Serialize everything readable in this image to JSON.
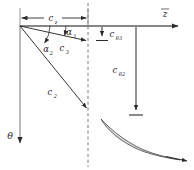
{
  "figure": {
    "type": "engineering-vector-diagram"
  },
  "axes": {
    "horizontal": {
      "name": "z-axis",
      "label": "z",
      "direction": "right",
      "x_start": 20,
      "x_end": 180,
      "y": 26
    },
    "vertical": {
      "name": "theta-axis",
      "label": "θ",
      "direction": "down",
      "x": 20,
      "y_start": 26,
      "y_end": 150
    }
  },
  "station_line": {
    "name": "station-dashed-line",
    "x": 88,
    "y_start": 4,
    "y_end": 166,
    "style": "dashed"
  },
  "dimension": {
    "label": "c",
    "subscript": "z",
    "full": "c_z",
    "y": 18,
    "x_start": 20,
    "x_end": 88
  },
  "vectors": [
    {
      "id": "c3",
      "label": "c",
      "subscript": "3",
      "full": "c_3",
      "x1": 20,
      "y1": 26,
      "x2": 88,
      "y2": 41,
      "label_x": 63,
      "label_y": 51
    },
    {
      "id": "c2",
      "label": "c",
      "subscript": "2",
      "full": "c_2",
      "x1": 20,
      "y1": 26,
      "x2": 88,
      "y2": 110,
      "label_x": 52,
      "label_y": 95
    }
  ],
  "angles": [
    {
      "id": "alpha3",
      "label": "α",
      "subscript": "3",
      "full": "α_3",
      "label_x": 69,
      "label_y": 34
    },
    {
      "id": "alpha2",
      "label": "α",
      "subscript": "2",
      "full": "α_2",
      "label_x": 47,
      "label_y": 51
    }
  ],
  "tangential_components": [
    {
      "id": "ctheta3",
      "label": "c",
      "subscript": "θ3",
      "full": "c_θ3",
      "x": 102,
      "y_start": 26,
      "y_end": 40,
      "label_x": 108,
      "label_y": 36
    },
    {
      "id": "ctheta2",
      "label": "c",
      "subscript": "θ2",
      "full": "c_θ2",
      "x": 136,
      "y_start": 26,
      "y_end": 115,
      "label_x": 120,
      "label_y": 72
    }
  ],
  "blade": {
    "name": "blade-vane-profile",
    "fill": "#d8d8d8",
    "stroke": "#555555",
    "outflow_arrow": {
      "x1": 167,
      "y1": 157,
      "x2": 186,
      "y2": 161
    }
  },
  "colors": {
    "line": "#2b2b2b",
    "dash": "#808080",
    "blade_fill": "#d9d9d9",
    "blade_stroke": "#4d4d4d",
    "background": "#ffffff"
  }
}
